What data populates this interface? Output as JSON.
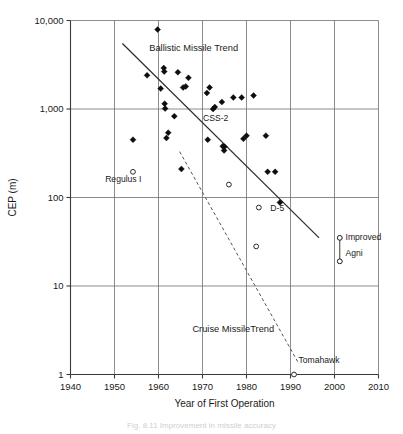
{
  "chart_data": {
    "type": "scatter",
    "title": "",
    "xlabel": "Year of First Operation",
    "ylabel": "CEP (m)",
    "xlim": [
      1940,
      2010
    ],
    "ylim": [
      1,
      10000
    ],
    "yscale": "log",
    "xticks": [
      1940,
      1950,
      1960,
      1970,
      1980,
      1990,
      2000,
      2010
    ],
    "xticklabels": [
      "1940",
      "1950",
      "1960",
      "1970",
      "1980",
      "1990",
      "2000",
      "2010"
    ],
    "yticks": [
      1,
      10,
      100,
      1000,
      10000
    ],
    "yticklabels": [
      "1",
      "10",
      "100",
      "1,000",
      "10,000"
    ],
    "grid": "both-major",
    "legend": "none",
    "series": [
      {
        "name": "Ballistic missiles",
        "marker": "filled-diamond",
        "points": [
          {
            "x": 1957.4,
            "y": 2400
          },
          {
            "x": 1959.8,
            "y": 7900
          },
          {
            "x": 1960.5,
            "y": 1700
          },
          {
            "x": 1961.2,
            "y": 2900
          },
          {
            "x": 1961.3,
            "y": 2650
          },
          {
            "x": 1961.4,
            "y": 1150
          },
          {
            "x": 1961.5,
            "y": 1010
          },
          {
            "x": 1961.8,
            "y": 470
          },
          {
            "x": 1962.2,
            "y": 540
          },
          {
            "x": 1963.6,
            "y": 830
          },
          {
            "x": 1964.4,
            "y": 2600
          },
          {
            "x": 1965.2,
            "y": 210
          },
          {
            "x": 1965.6,
            "y": 1750
          },
          {
            "x": 1966.2,
            "y": 1800
          },
          {
            "x": 1966.8,
            "y": 2250
          },
          {
            "x": 1954.2,
            "y": 450
          },
          {
            "x": 1971.0,
            "y": 1520
          },
          {
            "x": 1971.6,
            "y": 1750
          },
          {
            "x": 1971.2,
            "y": 450
          },
          {
            "x": 1972.4,
            "y": 1000
          },
          {
            "x": 1972.8,
            "y": 1050
          },
          {
            "x": 1974.4,
            "y": 1200
          },
          {
            "x": 1974.6,
            "y": 380
          },
          {
            "x": 1975.0,
            "y": 375
          },
          {
            "x": 1974.9,
            "y": 340
          },
          {
            "x": 1977.0,
            "y": 1350
          },
          {
            "x": 1978.9,
            "y": 1350
          },
          {
            "x": 1979.3,
            "y": 460
          },
          {
            "x": 1980.0,
            "y": 500
          },
          {
            "x": 1981.6,
            "y": 1420
          },
          {
            "x": 1984.4,
            "y": 500
          },
          {
            "x": 1984.8,
            "y": 195
          },
          {
            "x": 1986.5,
            "y": 195
          },
          {
            "x": 1987.6,
            "y": 88
          }
        ]
      },
      {
        "name": "Cruise missiles and other",
        "marker": "open-circle",
        "points": [
          {
            "x": 1954.2,
            "y": 195
          },
          {
            "x": 1976.0,
            "y": 140
          },
          {
            "x": 1982.8,
            "y": 77
          },
          {
            "x": 1982.2,
            "y": 28
          },
          {
            "x": 1990.8,
            "y": 1.0
          },
          {
            "x": 2001.2,
            "y": 35
          },
          {
            "x": 2001.2,
            "y": 19
          }
        ]
      }
    ],
    "trend_lines": [
      {
        "name": "Ballistic Missile Trend",
        "style": "solid",
        "x0": 1951.8,
        "y0": 5500,
        "x1": 1996.5,
        "y1": 35
      },
      {
        "name": "Cruise Missile Trend",
        "style": "dashed",
        "x0": 1964.8,
        "y0": 330,
        "x1": 1991.8,
        "y1": 1.35
      }
    ],
    "range_markers": [
      {
        "name": "Improved Agni",
        "x": 2001.2,
        "y_top": 35,
        "y_bottom": 19,
        "endpoint_marker": "open-circle"
      }
    ],
    "annotations": [
      {
        "name": "ballistic-trend-label",
        "text": "Ballistic Missile Trend",
        "x": 1968.0,
        "y": 4500
      },
      {
        "name": "cruise-trend-label",
        "text": "Cruise MissileTrend",
        "x": 1977.0,
        "y": 3.0
      },
      {
        "name": "regulus-label",
        "text": "Regulus I",
        "x": 1952.0,
        "y": 150
      },
      {
        "name": "css2-label",
        "text": "CSS-2",
        "x": 1973.0,
        "y": 740
      },
      {
        "name": "d5-label",
        "text": "D-5",
        "x": 1987.0,
        "y": 70
      },
      {
        "name": "tomahawk-label",
        "text": "Tomahawk",
        "x": 1991.8,
        "y": 1.35
      },
      {
        "name": "agni-label-line1",
        "text": "Improved",
        "x": 2002.5,
        "y": 33
      },
      {
        "name": "agni-label-line2",
        "text": "Agni",
        "x": 2002.5,
        "y": 22
      }
    ],
    "colors": {
      "axis": "#3a3a3a",
      "grid": "#6e6e6e",
      "marker_filled": "#0d0d0d",
      "marker_open_stroke": "#2b2b2b",
      "trend_solid": "#2b2b2b",
      "trend_dashed": "#555555",
      "background": "#ffffff",
      "text": "#1a1a1a"
    }
  },
  "caption": {
    "text": "Fig. 8.11  Improvement in missile accuracy"
  }
}
